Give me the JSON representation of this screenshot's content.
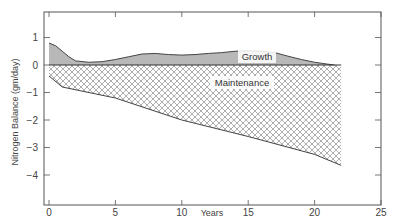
{
  "chart_data": {
    "type": "area",
    "title": "",
    "xlabel": "Years",
    "ylabel": "Nitrogen Balance (gm/day)",
    "xlim": [
      0,
      25
    ],
    "ylim": [
      -5.1,
      1.9
    ],
    "x_ticks": [
      0,
      5,
      10,
      15,
      20,
      25
    ],
    "y_ticks": [
      1,
      0,
      -1,
      -2,
      -3,
      -4
    ],
    "y_tick_labels": [
      "1",
      "0",
      "−1",
      "−2",
      "−3",
      "−4"
    ],
    "grid": false,
    "legend": null,
    "series": [
      {
        "name": "Growth",
        "fill": "solid gray (above zero)",
        "x": [
          0,
          0.5,
          1,
          1.5,
          2,
          3,
          4,
          5,
          6,
          7,
          8,
          9,
          10,
          11,
          12,
          13,
          14,
          15,
          16,
          17,
          18,
          19,
          20,
          21,
          21.5
        ],
        "values": [
          0.8,
          0.7,
          0.5,
          0.3,
          0.15,
          0.1,
          0.12,
          0.2,
          0.3,
          0.4,
          0.42,
          0.38,
          0.36,
          0.38,
          0.42,
          0.45,
          0.5,
          0.52,
          0.5,
          0.45,
          0.32,
          0.2,
          0.1,
          0.03,
          0
        ]
      },
      {
        "name": "Maintenance",
        "fill": "cross-hatch (below zero)",
        "x": [
          0,
          1,
          5,
          10,
          15,
          20,
          22
        ],
        "values": [
          -0.4,
          -0.8,
          -1.2,
          -2.0,
          -2.6,
          -3.25,
          -3.65
        ]
      }
    ],
    "annotations": [
      {
        "text": "Growth",
        "x": 16.5,
        "y": 0.25
      },
      {
        "text": "Maintenance",
        "x": 16,
        "y": -0.7
      }
    ]
  },
  "labels": {
    "xlabel": "Years",
    "ylabel": "Nitrogen Balance (gm/day)",
    "growth": "Growth",
    "maintenance": "Maintenance"
  },
  "colors": {
    "growth_fill": "#b8b8b8",
    "hatch": "#777777",
    "axis": "#555555",
    "text": "#444444"
  }
}
